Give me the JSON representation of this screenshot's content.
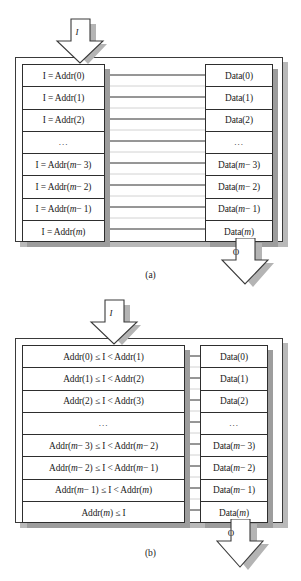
{
  "figure": {
    "type": "block-diagram",
    "colors": {
      "line": "#2e2e2e",
      "shadow": "#9d9d9d",
      "outer_shadow": "#b9b9b9",
      "background": "#ffffff",
      "text": "#1a1a1a"
    }
  },
  "panels": [
    {
      "id": "panel-a",
      "caption": "(a)",
      "input_arrow": {
        "label": "I",
        "direction": "down",
        "name": "input-arrow"
      },
      "output_arrow": {
        "label": "O",
        "direction": "down",
        "name": "output-arrow"
      },
      "address_column": {
        "name": "address-column",
        "rows": [
          {
            "text": "I = Addr(0)",
            "ellipsis": false
          },
          {
            "text": "I = Addr(1)",
            "ellipsis": false
          },
          {
            "text": "I = Addr(2)",
            "ellipsis": false
          },
          {
            "text": "...",
            "ellipsis": true
          },
          {
            "text": "I = Addr(m − 3)",
            "ellipsis": false
          },
          {
            "text": "I = Addr(m − 2)",
            "ellipsis": false
          },
          {
            "text": "I = Addr(m − 1)",
            "ellipsis": false
          },
          {
            "text": "I = Addr(m)",
            "ellipsis": false
          }
        ]
      },
      "data_column": {
        "name": "data-column",
        "rows": [
          {
            "text": "Data(0)",
            "ellipsis": false
          },
          {
            "text": "Data(1)",
            "ellipsis": false
          },
          {
            "text": "Data(2)",
            "ellipsis": false
          },
          {
            "text": "...",
            "ellipsis": true
          },
          {
            "text": "Data(m − 3)",
            "ellipsis": false
          },
          {
            "text": "Data(m − 2)",
            "ellipsis": false
          },
          {
            "text": "Data(m − 1)",
            "ellipsis": false
          },
          {
            "text": "Data(m)",
            "ellipsis": false
          }
        ]
      }
    },
    {
      "id": "panel-b",
      "caption": "(b)",
      "input_arrow": {
        "label": "I",
        "direction": "down",
        "name": "input-arrow"
      },
      "output_arrow": {
        "label": "O",
        "direction": "down",
        "name": "output-arrow"
      },
      "address_column": {
        "name": "address-range-column",
        "rows": [
          {
            "text": "Addr(0) ≤ I < Addr(1)",
            "ellipsis": false
          },
          {
            "text": "Addr(1) ≤ I < Addr(2)",
            "ellipsis": false
          },
          {
            "text": "Addr(2) ≤ I < Addr(3)",
            "ellipsis": false
          },
          {
            "text": "...",
            "ellipsis": true
          },
          {
            "text": "Addr(m − 3) ≤ I < Addr(m − 2)",
            "ellipsis": false
          },
          {
            "text": "Addr(m − 2) ≤ I < Addr(m − 1)",
            "ellipsis": false
          },
          {
            "text": "Addr(m − 1) ≤ I < Addr(m)",
            "ellipsis": false
          },
          {
            "text": "Addr(m) ≤ I",
            "ellipsis": false
          }
        ]
      },
      "data_column": {
        "name": "data-column",
        "rows": [
          {
            "text": "Data(0)",
            "ellipsis": false
          },
          {
            "text": "Data(1)",
            "ellipsis": false
          },
          {
            "text": "Data(2)",
            "ellipsis": false
          },
          {
            "text": "...",
            "ellipsis": true
          },
          {
            "text": "Data(m − 3)",
            "ellipsis": false
          },
          {
            "text": "Data(m − 2)",
            "ellipsis": false
          },
          {
            "text": "Data(m − 1)",
            "ellipsis": false
          },
          {
            "text": "Data(m)",
            "ellipsis": false
          }
        ]
      }
    }
  ]
}
